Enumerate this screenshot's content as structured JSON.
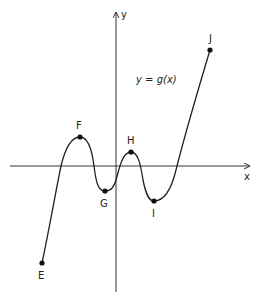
{
  "diagram": {
    "equation_label": "y = g(x)",
    "axes": {
      "x_label": "x",
      "y_label": "y"
    },
    "points": [
      {
        "label": "E",
        "x": 42,
        "y": 263,
        "label_x": 38,
        "label_y": 279
      },
      {
        "label": "F",
        "x": 80,
        "y": 137,
        "label_x": 76,
        "label_y": 129
      },
      {
        "label": "G",
        "x": 105,
        "y": 191,
        "label_x": 100,
        "label_y": 207
      },
      {
        "label": "H",
        "x": 131,
        "y": 152,
        "label_x": 127,
        "label_y": 144
      },
      {
        "label": "I",
        "x": 154,
        "y": 201,
        "label_x": 152,
        "label_y": 217
      },
      {
        "label": "J",
        "x": 210,
        "y": 50,
        "label_x": 209,
        "label_y": 42
      }
    ]
  },
  "colors": {
    "line": "#222222",
    "background": "#ffffff"
  }
}
